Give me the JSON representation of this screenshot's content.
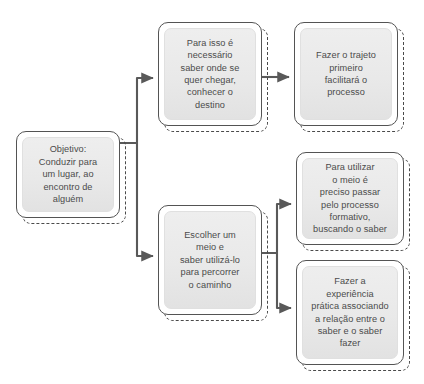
{
  "diagram": {
    "title": "",
    "theme": {
      "background": "#ffffff",
      "box_fill": "#e9e9e9",
      "box_border": "#545454",
      "dashed_border": "#4a4a4a",
      "text_color": "#4b4b4b",
      "connector_color": "#595959"
    },
    "nodes": [
      {
        "id": "objetivo",
        "text": "Objetivo:\nConduzir para\num lugar, ao\nencontro de\nalguém",
        "x": 16,
        "y": 131,
        "w": 104,
        "h": 87
      },
      {
        "id": "destino",
        "text": "Para isso é\nnecessário\nsaber onde se\nquer chegar,\nconhecer o\ndestino",
        "x": 158,
        "y": 22,
        "w": 104,
        "h": 104
      },
      {
        "id": "trajeto",
        "text": "Fazer o trajeto\nprimeiro\nfacilitará o\nprocesso",
        "x": 294,
        "y": 22,
        "w": 104,
        "h": 104
      },
      {
        "id": "meio",
        "text": "Escolher um\nmeio e\nsaber utilizá-lo\npara  percorrer\no caminho",
        "x": 158,
        "y": 205,
        "w": 104,
        "h": 110
      },
      {
        "id": "formativo",
        "text": "Para utilizar\no meio é\npreciso  passar\npelo processo\nformativo,\nbuscando o saber",
        "x": 296,
        "y": 152,
        "w": 108,
        "h": 93
      },
      {
        "id": "pratica",
        "text": "Fazer a\nexperiência\nprática associando\na relação entre o\nsaber e o saber\nfazer",
        "x": 296,
        "y": 260,
        "w": 108,
        "h": 105
      }
    ],
    "connectors": [
      {
        "id": "objetivo-to-destino",
        "from": "objetivo",
        "to": "destino",
        "arrow": true
      },
      {
        "id": "objetivo-to-meio",
        "from": "objetivo",
        "to": "meio",
        "arrow": true
      },
      {
        "id": "destino-to-trajeto",
        "from": "destino",
        "to": "trajeto",
        "arrow": true
      },
      {
        "id": "meio-to-formativo",
        "from": "meio",
        "to": "formativo",
        "arrow": true
      },
      {
        "id": "meio-to-pratica",
        "from": "meio",
        "to": "pratica",
        "arrow": true
      }
    ]
  }
}
